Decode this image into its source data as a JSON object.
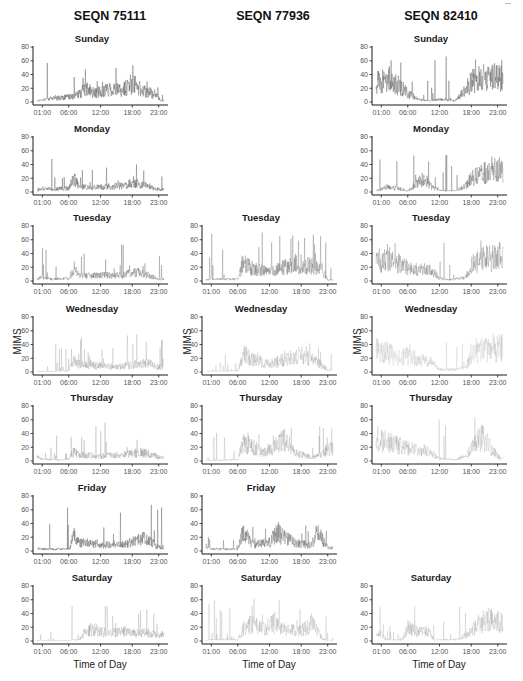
{
  "figure": {
    "columns": [
      {
        "title": "SEQN 75111"
      },
      {
        "title": "SEQN 77936"
      },
      {
        "title": "SEQN 82410"
      }
    ],
    "ylabel": "MIMS",
    "xlabel": "Time of Day",
    "yticks": [
      "80",
      "60",
      "40",
      "20",
      "0"
    ],
    "xticks": [
      "01:00",
      "06:00",
      "12:00",
      "18:00",
      "23:00"
    ],
    "days": [
      "Sunday",
      "Monday",
      "Tuesday",
      "Wednesday",
      "Thursday",
      "Friday",
      "Saturday"
    ]
  },
  "chart_data": {
    "type": "line",
    "title": "",
    "xlabel": "Time of Day",
    "ylabel": "MIMS",
    "ylim": [
      0,
      80
    ],
    "xlim": [
      "00:00",
      "24:00"
    ],
    "grid": false,
    "panels": [
      {
        "seqn": "SEQN 75111",
        "day": "Sunday",
        "present": true,
        "opacity": 0.75,
        "peak": 57,
        "profile": [
          [
            0,
            2
          ],
          [
            1,
            4
          ],
          [
            3,
            6
          ],
          [
            6,
            8
          ],
          [
            8,
            12
          ],
          [
            9,
            22
          ],
          [
            11,
            14
          ],
          [
            14,
            22
          ],
          [
            16,
            18
          ],
          [
            18,
            30
          ],
          [
            20,
            18
          ],
          [
            22,
            14
          ],
          [
            23.5,
            2
          ]
        ]
      },
      {
        "seqn": "SEQN 75111",
        "day": "Monday",
        "present": true,
        "opacity": 0.7,
        "peak": 58,
        "profile": [
          [
            0,
            2
          ],
          [
            1,
            6
          ],
          [
            3,
            5
          ],
          [
            6,
            6
          ],
          [
            7,
            22
          ],
          [
            8,
            8
          ],
          [
            12,
            8
          ],
          [
            16,
            10
          ],
          [
            18,
            14
          ],
          [
            20,
            12
          ],
          [
            22,
            6
          ],
          [
            23.5,
            4
          ]
        ]
      },
      {
        "seqn": "SEQN 75111",
        "day": "Tuesday",
        "present": true,
        "opacity": 0.55,
        "peak": 55,
        "profile": [
          [
            0,
            3
          ],
          [
            1,
            6
          ],
          [
            3,
            3
          ],
          [
            6,
            4
          ],
          [
            7,
            20
          ],
          [
            8,
            8
          ],
          [
            12,
            9
          ],
          [
            16,
            10
          ],
          [
            19,
            14
          ],
          [
            21,
            10
          ],
          [
            23,
            3
          ]
        ]
      },
      {
        "seqn": "SEQN 75111",
        "day": "Wednesday",
        "present": true,
        "opacity": 0.3,
        "peak": 55,
        "profile": [
          [
            0,
            1
          ],
          [
            3,
            1
          ],
          [
            6,
            2
          ],
          [
            7,
            18
          ],
          [
            8,
            12
          ],
          [
            12,
            10
          ],
          [
            15,
            8
          ],
          [
            18,
            12
          ],
          [
            21,
            14
          ],
          [
            23,
            8
          ]
        ]
      },
      {
        "seqn": "SEQN 75111",
        "day": "Thursday",
        "present": true,
        "opacity": 0.35,
        "peak": 60,
        "profile": [
          [
            0,
            8
          ],
          [
            1,
            3
          ],
          [
            5,
            2
          ],
          [
            6,
            3
          ],
          [
            7,
            16
          ],
          [
            8,
            10
          ],
          [
            12,
            8
          ],
          [
            16,
            9
          ],
          [
            18,
            12
          ],
          [
            20,
            14
          ],
          [
            22,
            10
          ],
          [
            23,
            6
          ]
        ]
      },
      {
        "seqn": "SEQN 75111",
        "day": "Friday",
        "present": true,
        "opacity": 0.7,
        "peak": 68,
        "profile": [
          [
            0,
            4
          ],
          [
            2,
            3
          ],
          [
            6,
            3
          ],
          [
            7,
            26
          ],
          [
            8,
            14
          ],
          [
            12,
            10
          ],
          [
            16,
            10
          ],
          [
            18,
            14
          ],
          [
            20,
            20
          ],
          [
            22,
            12
          ],
          [
            23,
            6
          ]
        ]
      },
      {
        "seqn": "SEQN 75111",
        "day": "Saturday",
        "present": true,
        "opacity": 0.3,
        "peak": 55,
        "profile": [
          [
            0,
            1
          ],
          [
            6,
            1
          ],
          [
            8,
            2
          ],
          [
            9,
            15
          ],
          [
            11,
            18
          ],
          [
            13,
            12
          ],
          [
            15,
            14
          ],
          [
            17,
            15
          ],
          [
            19,
            12
          ],
          [
            21,
            14
          ],
          [
            23,
            10
          ]
        ]
      },
      {
        "seqn": "SEQN 77936",
        "day": "Sunday",
        "present": false
      },
      {
        "seqn": "SEQN 77936",
        "day": "Monday",
        "present": false
      },
      {
        "seqn": "SEQN 77936",
        "day": "Tuesday",
        "present": true,
        "opacity": 0.5,
        "peak": 73,
        "profile": [
          [
            0,
            2
          ],
          [
            2,
            3
          ],
          [
            6,
            3
          ],
          [
            7,
            28
          ],
          [
            9,
            20
          ],
          [
            12,
            14
          ],
          [
            15,
            22
          ],
          [
            17,
            28
          ],
          [
            20,
            24
          ],
          [
            22,
            18
          ],
          [
            23,
            2
          ]
        ]
      },
      {
        "seqn": "SEQN 77936",
        "day": "Wednesday",
        "present": true,
        "opacity": 0.25,
        "peak": 45,
        "profile": [
          [
            0,
            1
          ],
          [
            6,
            2
          ],
          [
            7,
            28
          ],
          [
            9,
            22
          ],
          [
            12,
            12
          ],
          [
            15,
            22
          ],
          [
            18,
            26
          ],
          [
            21,
            16
          ],
          [
            23,
            4
          ]
        ]
      },
      {
        "seqn": "SEQN 77936",
        "day": "Thursday",
        "present": true,
        "opacity": 0.3,
        "peak": 52,
        "profile": [
          [
            0,
            1
          ],
          [
            6,
            2
          ],
          [
            7,
            30
          ],
          [
            9,
            22
          ],
          [
            11,
            14
          ],
          [
            13,
            24
          ],
          [
            15,
            34
          ],
          [
            17,
            12
          ],
          [
            20,
            6
          ],
          [
            22,
            10
          ],
          [
            23,
            20
          ]
        ]
      },
      {
        "seqn": "SEQN 77936",
        "day": "Friday",
        "present": true,
        "opacity": 0.6,
        "peak": 50,
        "profile": [
          [
            0,
            8
          ],
          [
            1,
            3
          ],
          [
            6,
            3
          ],
          [
            7,
            30
          ],
          [
            9,
            10
          ],
          [
            12,
            14
          ],
          [
            13,
            28
          ],
          [
            15,
            24
          ],
          [
            17,
            12
          ],
          [
            20,
            10
          ],
          [
            21,
            32
          ],
          [
            23,
            6
          ]
        ]
      },
      {
        "seqn": "SEQN 77936",
        "day": "Saturday",
        "present": true,
        "opacity": 0.25,
        "peak": 62,
        "profile": [
          [
            0,
            1
          ],
          [
            2,
            3
          ],
          [
            6,
            2
          ],
          [
            7,
            20
          ],
          [
            9,
            30
          ],
          [
            11,
            18
          ],
          [
            13,
            30
          ],
          [
            15,
            18
          ],
          [
            18,
            16
          ],
          [
            20,
            28
          ],
          [
            22,
            4
          ],
          [
            23,
            1
          ]
        ]
      },
      {
        "seqn": "SEQN 82410",
        "day": "Sunday",
        "present": true,
        "opacity": 0.7,
        "peak": 67,
        "profile": [
          [
            0,
            32
          ],
          [
            2,
            38
          ],
          [
            4,
            28
          ],
          [
            6,
            14
          ],
          [
            8,
            4
          ],
          [
            10,
            2
          ],
          [
            12,
            4
          ],
          [
            15,
            2
          ],
          [
            17,
            22
          ],
          [
            18,
            34
          ],
          [
            20,
            38
          ],
          [
            22,
            40
          ],
          [
            23.5,
            42
          ]
        ]
      },
      {
        "seqn": "SEQN 82410",
        "day": "Monday",
        "present": true,
        "opacity": 0.6,
        "peak": 57,
        "profile": [
          [
            0,
            2
          ],
          [
            2,
            8
          ],
          [
            4,
            6
          ],
          [
            6,
            2
          ],
          [
            9,
            22
          ],
          [
            11,
            6
          ],
          [
            13,
            2
          ],
          [
            15,
            2
          ],
          [
            17,
            10
          ],
          [
            18,
            22
          ],
          [
            20,
            30
          ],
          [
            22,
            34
          ],
          [
            23.5,
            36
          ]
        ]
      },
      {
        "seqn": "SEQN 82410",
        "day": "Tuesday",
        "present": true,
        "opacity": 0.45,
        "peak": 60,
        "profile": [
          [
            0,
            34
          ],
          [
            2,
            32
          ],
          [
            4,
            30
          ],
          [
            5,
            26
          ],
          [
            7,
            18
          ],
          [
            9,
            20
          ],
          [
            11,
            14
          ],
          [
            12,
            4
          ],
          [
            14,
            2
          ],
          [
            17,
            6
          ],
          [
            18,
            26
          ],
          [
            20,
            38
          ],
          [
            22,
            36
          ],
          [
            23.5,
            40
          ]
        ]
      },
      {
        "seqn": "SEQN 82410",
        "day": "Wednesday",
        "present": true,
        "opacity": 0.2,
        "peak": 58,
        "profile": [
          [
            0,
            36
          ],
          [
            2,
            32
          ],
          [
            4,
            22
          ],
          [
            6,
            26
          ],
          [
            8,
            20
          ],
          [
            10,
            18
          ],
          [
            12,
            4
          ],
          [
            15,
            4
          ],
          [
            17,
            8
          ],
          [
            18,
            26
          ],
          [
            20,
            36
          ],
          [
            22,
            40
          ],
          [
            23.5,
            38
          ]
        ]
      },
      {
        "seqn": "SEQN 82410",
        "day": "Thursday",
        "present": true,
        "opacity": 0.25,
        "peak": 65,
        "profile": [
          [
            0,
            36
          ],
          [
            2,
            30
          ],
          [
            4,
            26
          ],
          [
            6,
            20
          ],
          [
            8,
            18
          ],
          [
            10,
            16
          ],
          [
            12,
            4
          ],
          [
            15,
            2
          ],
          [
            17,
            8
          ],
          [
            18,
            20
          ],
          [
            20,
            40
          ],
          [
            22,
            18
          ],
          [
            23.5,
            4
          ]
        ]
      },
      {
        "seqn": "SEQN 82410",
        "day": "Friday",
        "present": false
      },
      {
        "seqn": "SEQN 82410",
        "day": "Saturday",
        "present": true,
        "opacity": 0.25,
        "peak": 52,
        "profile": [
          [
            0,
            10
          ],
          [
            1,
            12
          ],
          [
            2,
            2
          ],
          [
            5,
            2
          ],
          [
            6,
            22
          ],
          [
            8,
            14
          ],
          [
            10,
            16
          ],
          [
            11,
            2
          ],
          [
            14,
            2
          ],
          [
            16,
            4
          ],
          [
            18,
            16
          ],
          [
            20,
            32
          ],
          [
            22,
            34
          ],
          [
            23.5,
            32
          ]
        ]
      }
    ]
  },
  "colors": {
    "trace": "#5a5a5a",
    "axis": "#1a1a1a",
    "tick_text": "#555555"
  }
}
